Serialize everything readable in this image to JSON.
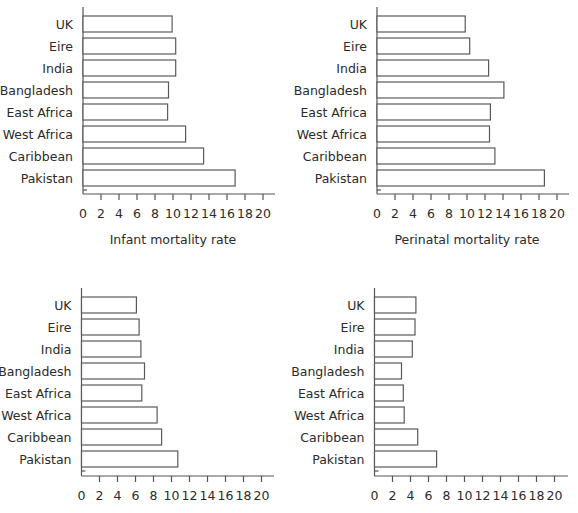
{
  "chart_data": [
    {
      "type": "bar",
      "orientation": "horizontal",
      "position": "top-left",
      "title": "",
      "xlabel": "Infant mortality rate",
      "ylabel": "",
      "categories": [
        "UK",
        "Eire",
        "India",
        "Bangladesh",
        "East Africa",
        "West Africa",
        "Caribbean",
        "Pakistan"
      ],
      "values": [
        9.9,
        10.3,
        10.3,
        9.5,
        9.4,
        11.4,
        13.4,
        16.9
      ],
      "xlim": [
        0,
        20
      ],
      "xticks": [
        0,
        2,
        4,
        6,
        8,
        10,
        12,
        14,
        16,
        18,
        20
      ],
      "grid": false,
      "legend": null
    },
    {
      "type": "bar",
      "orientation": "horizontal",
      "position": "top-right",
      "title": "",
      "xlabel": "Perinatal mortality rate",
      "ylabel": "",
      "categories": [
        "UK",
        "Eire",
        "India",
        "Bangladesh",
        "East Africa",
        "West Africa",
        "Caribbean",
        "Pakistan"
      ],
      "values": [
        9.8,
        10.3,
        12.4,
        14.1,
        12.6,
        12.5,
        13.1,
        18.6
      ],
      "xlim": [
        0,
        20
      ],
      "xticks": [
        0,
        2,
        4,
        6,
        8,
        10,
        12,
        14,
        16,
        18,
        20
      ],
      "grid": false,
      "legend": null
    },
    {
      "type": "bar",
      "orientation": "horizontal",
      "position": "bottom-left",
      "title": "",
      "xlabel": "",
      "ylabel": "",
      "categories": [
        "UK",
        "Eire",
        "India",
        "Bangladesh",
        "East Africa",
        "West Africa",
        "Caribbean",
        "Pakistan"
      ],
      "values": [
        6.1,
        6.4,
        6.6,
        7.0,
        6.7,
        8.4,
        8.9,
        10.7
      ],
      "xlim": [
        0,
        20
      ],
      "xticks": [
        0,
        2,
        4,
        6,
        8,
        10,
        12,
        14,
        16,
        18,
        20
      ],
      "grid": false,
      "legend": null
    },
    {
      "type": "bar",
      "orientation": "horizontal",
      "position": "bottom-right",
      "title": "",
      "xlabel": "",
      "ylabel": "",
      "categories": [
        "UK",
        "Eire",
        "India",
        "Bangladesh",
        "East Africa",
        "West Africa",
        "Caribbean",
        "Pakistan"
      ],
      "values": [
        4.6,
        4.5,
        4.2,
        3.0,
        3.2,
        3.3,
        4.8,
        6.9
      ],
      "xlim": [
        0,
        20
      ],
      "xticks": [
        0,
        2,
        4,
        6,
        8,
        10,
        12,
        14,
        16,
        18,
        20
      ],
      "grid": false,
      "legend": null
    }
  ],
  "colors": {
    "bar_fill": "#ffffff",
    "bar_stroke": "#5a5a5a",
    "axis": "#555555",
    "text": "#2b2b2b"
  }
}
